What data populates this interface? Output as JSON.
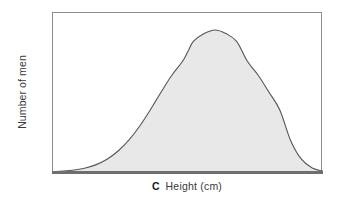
{
  "figure": {
    "panel_letter": "C",
    "background_color": "#ffffff"
  },
  "axes": {
    "x_label": "Height (cm)",
    "y_label": "Number of men",
    "frame_color": "#8e8e8e",
    "baseline_color": "#6e6e6e"
  },
  "chart_data": {
    "type": "area",
    "title": "",
    "subtitle": "",
    "panel_label": "C",
    "xlabel": "Height (cm)",
    "ylabel": "Number of men",
    "distribution": "normal",
    "curve_stroke_color": "#555555",
    "fill_color": "#e8e8e8",
    "grid": false,
    "legend": null,
    "x_tick_labels": [],
    "y_tick_labels": [],
    "xlim": [
      0,
      100
    ],
    "ylim": [
      0,
      100
    ],
    "peak_x": 50,
    "peak_y": 100,
    "x": [
      0,
      4,
      8,
      12,
      16,
      20,
      24,
      28,
      32,
      36,
      40,
      44,
      48,
      50,
      52,
      56,
      60,
      64,
      68,
      72,
      76,
      80,
      84,
      88,
      92,
      96,
      100
    ],
    "values": [
      0.4,
      0.8,
      1.6,
      3.0,
      5.4,
      9.2,
      14.8,
      22.4,
      32.2,
      43.8,
      56.2,
      68.2,
      78.0,
      85.0,
      92.0,
      97.5,
      100.0,
      97.5,
      92.0,
      78.0,
      68.2,
      56.2,
      43.8,
      22.4,
      9.2,
      3.0,
      0.8
    ],
    "series": [
      {
        "name": "Number of men",
        "values": [
          0.4,
          0.8,
          1.6,
          3.0,
          5.4,
          9.2,
          14.8,
          22.4,
          32.2,
          43.8,
          56.2,
          68.2,
          78.0,
          85.0,
          92.0,
          97.5,
          100.0,
          97.5,
          92.0,
          78.0,
          68.2,
          56.2,
          43.8,
          22.4,
          9.2,
          3.0,
          0.8
        ]
      }
    ]
  }
}
